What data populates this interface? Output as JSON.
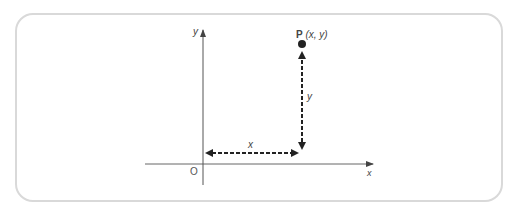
{
  "diagram": {
    "type": "cartesian-point",
    "origin_label": "O",
    "x_axis_label": "x",
    "y_axis_label": "y",
    "point": {
      "name": "P",
      "coords": "(x, y)"
    },
    "x_distance_label": "x",
    "y_distance_label": "y",
    "colors": {
      "frame": "#d9d9d9",
      "axis": "#555555",
      "arrow": "#222222"
    }
  }
}
